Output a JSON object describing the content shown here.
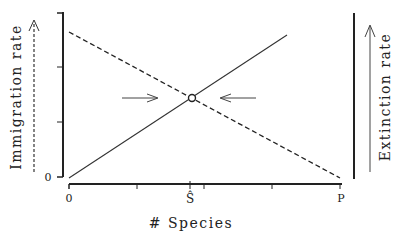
{
  "diagram": {
    "y_left_label": "Immigration rate",
    "y_right_label": "Extinction rate",
    "x_label": "# Species",
    "y_origin_label": "0",
    "x_ticks": {
      "origin": "0",
      "equilibrium": "Ŝ",
      "pool": "P"
    },
    "curves": [
      {
        "name": "Immigration",
        "style": "dashed",
        "from": [
          0,
          "high"
        ],
        "to": [
          "P",
          0
        ]
      },
      {
        "name": "Extinction",
        "style": "solid",
        "from": [
          0,
          0
        ],
        "to": [
          "beyond Ŝ",
          "high"
        ]
      }
    ],
    "equilibrium_marker": "open circle at intersection",
    "arrows": [
      "right-pointing arrow toward equilibrium from left",
      "left-pointing arrow toward equilibrium from right"
    ],
    "colors": {
      "ink": "#222222",
      "background": "#ffffff"
    }
  }
}
